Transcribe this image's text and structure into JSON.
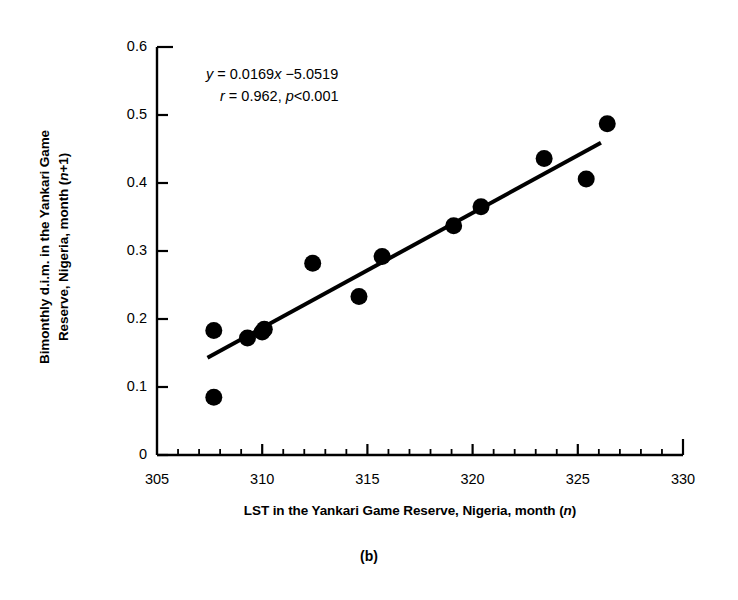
{
  "caption": "(b)",
  "chart_data": {
    "type": "scatter",
    "title": "",
    "xlabel": "LST in the Yankari Game  Reserve, Nigeria, month (n)",
    "xlabel_parts": {
      "prefix": "LST in the Yankari Game  Reserve, Nigeria, month (",
      "italic": "n",
      "suffix": ")"
    },
    "ylabel": "Bimonthly d.i.m. in the Yankari Game Reserve, Nigeria, month (n+1)",
    "ylabel_lines": [
      "Bimonthly d.i.m. in the Yankari Game",
      "Reserve, Nigeria, month (n+1)"
    ],
    "ylabel_line1": "Bimonthly d.i.m. in the Yankari Game",
    "ylabel_line2_prefix": "Reserve, Nigeria, month (",
    "ylabel_line2_italic": "n",
    "ylabel_line2_suffix": "+1)",
    "xlim": [
      305,
      330
    ],
    "ylim": [
      0,
      0.6
    ],
    "xticks": [
      305,
      310,
      315,
      320,
      325,
      330
    ],
    "xtick_labels": [
      "305",
      "310",
      "315",
      "320",
      "325",
      "330"
    ],
    "xminor_step": 1,
    "yticks": [
      0,
      0.1,
      0.2,
      0.3,
      0.4,
      0.5,
      0.6
    ],
    "ytick_labels": [
      "0",
      "0.1",
      "0.2",
      "0.3",
      "0.4",
      "0.5",
      "0.6"
    ],
    "grid": false,
    "legend": "none",
    "marker": "filled-circle",
    "marker_color": "#000000",
    "marker_size": 17,
    "points": [
      {
        "x": 307.7,
        "y": 0.183
      },
      {
        "x": 307.7,
        "y": 0.085
      },
      {
        "x": 309.3,
        "y": 0.172
      },
      {
        "x": 310.0,
        "y": 0.181
      },
      {
        "x": 310.1,
        "y": 0.185
      },
      {
        "x": 312.4,
        "y": 0.282
      },
      {
        "x": 314.6,
        "y": 0.233
      },
      {
        "x": 315.7,
        "y": 0.292
      },
      {
        "x": 319.1,
        "y": 0.337
      },
      {
        "x": 320.4,
        "y": 0.365
      },
      {
        "x": 323.4,
        "y": 0.436
      },
      {
        "x": 325.4,
        "y": 0.406
      },
      {
        "x": 326.4,
        "y": 0.487
      }
    ],
    "fit_line": {
      "slope": 0.0169,
      "intercept": -5.0519,
      "x_start": 307.4,
      "x_end": 326.1,
      "color": "#000000",
      "width": 4
    },
    "annotation": {
      "equation_y": "y",
      "equation_rest": " = 0.0169",
      "equation_x": "x",
      "equation_tail": " −5.0519",
      "stats_r": "r",
      "stats_r_value": " = 0.962, ",
      "stats_p": "p",
      "stats_p_value": "<0.001",
      "equation_full": "y = 0.0169x −5.0519",
      "stats_full": "r = 0.962, p<0.001"
    },
    "axis_color": "#000000",
    "background": "#ffffff"
  }
}
